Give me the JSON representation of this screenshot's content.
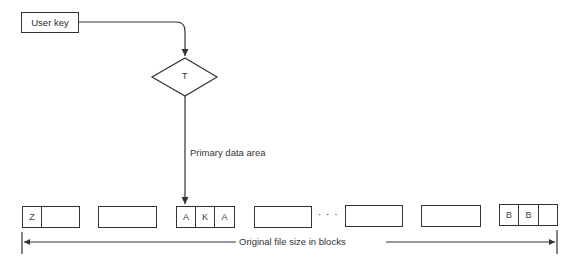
{
  "diagram": {
    "input_box": {
      "label": "User key"
    },
    "decision": {
      "label": "T"
    },
    "connector_label": "Primary data area",
    "ellipsis": "· · ·",
    "blocks": [
      {
        "cells": [
          {
            "label": "Z",
            "w": 19
          },
          {
            "label": "",
            "w": 38
          }
        ]
      },
      {
        "cells": [
          {
            "label": "",
            "w": 58
          }
        ]
      },
      {
        "cells": [
          {
            "label": "A",
            "w": 19
          },
          {
            "label": "K",
            "w": 19
          },
          {
            "label": "A",
            "w": 20
          }
        ]
      },
      {
        "cells": [
          {
            "label": "",
            "w": 57
          }
        ]
      },
      {
        "cells": [
          {
            "label": "",
            "w": 57
          }
        ]
      },
      {
        "cells": [
          {
            "label": "",
            "w": 59
          }
        ]
      },
      {
        "cells": [
          {
            "label": "B",
            "w": 19
          },
          {
            "label": "B",
            "w": 20
          },
          {
            "label": "",
            "w": 19
          }
        ]
      }
    ],
    "dimension_label": "Original file size in blocks"
  }
}
